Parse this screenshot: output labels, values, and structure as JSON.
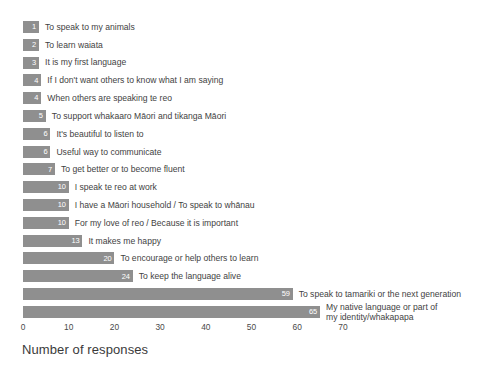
{
  "chart_data": {
    "type": "bar",
    "orientation": "horizontal",
    "title": "",
    "xlabel": "Number of responses",
    "ylabel": "",
    "xlim": [
      0,
      75
    ],
    "xticks": [
      0,
      10,
      20,
      30,
      40,
      50,
      60,
      70
    ],
    "grid": false,
    "legend": null,
    "bar_color": "#8f8f8f",
    "value_label_color": "#ffffff",
    "categories": [
      "To speak to my animals",
      "To learn waiata",
      "It is my first language",
      "If I don't want others to know what I am saying",
      "When others are speaking te reo",
      "To support whakaaro Māori and tikanga Māori",
      "It's beautiful to listen to",
      "Useful way to communicate",
      "To get better or to become fluent",
      "I speak te reo at work",
      "I have a Māori household / To speak to whānau",
      "For my love of reo / Because it is important",
      "It makes me happy",
      "To encourage or help others to learn",
      "To keep the language alive",
      "To speak to tamariki or the next generation",
      "My native language or part of\nmy identity/whakapapa"
    ],
    "values": [
      1,
      2,
      3,
      4,
      4,
      5,
      6,
      6,
      7,
      10,
      10,
      10,
      13,
      20,
      24,
      59,
      65
    ],
    "value_labels": [
      "1",
      "2",
      "3",
      "4",
      "4",
      "5",
      "6",
      "6",
      "7",
      "10",
      "10",
      "10",
      "13",
      "20",
      "24",
      "59",
      "65"
    ]
  }
}
